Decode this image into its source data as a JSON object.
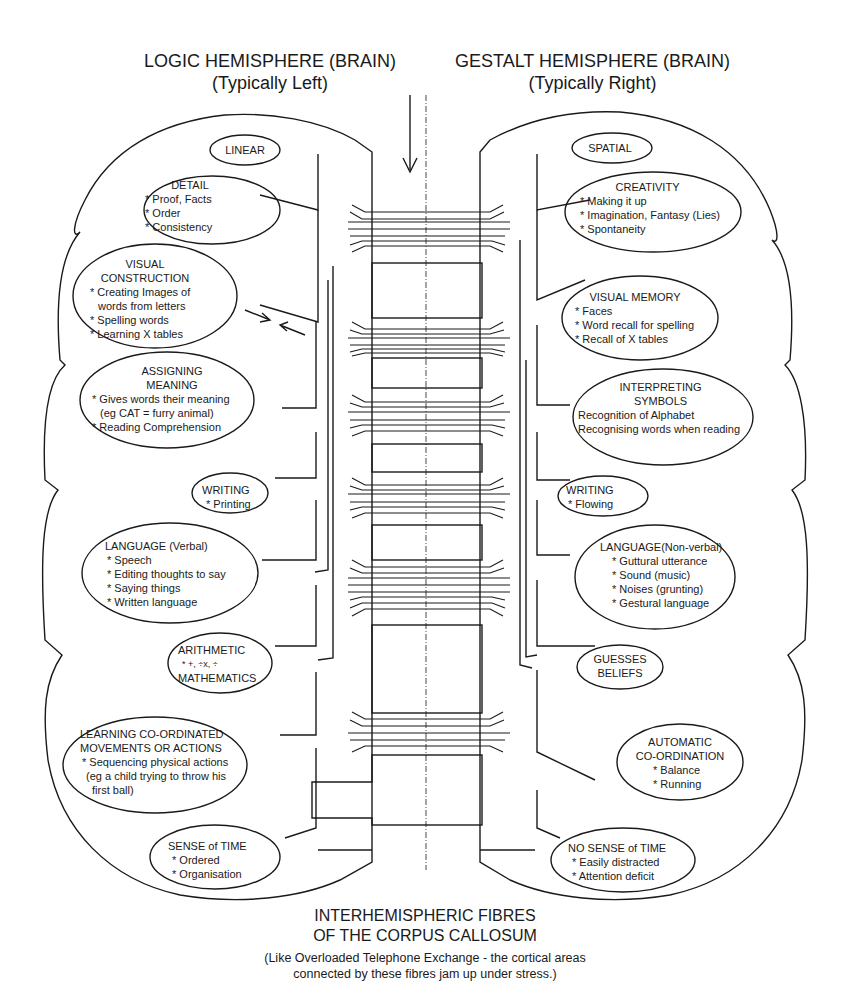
{
  "headers": {
    "left": {
      "title": "LOGIC HEMISPHERE (BRAIN)",
      "subtitle": "(Typically Left)"
    },
    "right": {
      "title": "GESTALT HEMISPHERE (BRAIN)",
      "subtitle": "(Typically Right)"
    }
  },
  "left_nodes": [
    {
      "title": "LINEAR",
      "items": []
    },
    {
      "title": "DETAIL",
      "items": [
        "* Proof, Facts",
        "* Order",
        "* Consistency"
      ]
    },
    {
      "title": "VISUAL\nCONSTRUCTION",
      "items": [
        "* Creating Images of",
        "  words from letters",
        "* Spelling words",
        "* Learning X tables"
      ]
    },
    {
      "title": "ASSIGNING\nMEANING",
      "items": [
        "* Gives words their meaning",
        "  (eg CAT = furry animal)",
        "* Reading Comprehension"
      ]
    },
    {
      "title": "WRITING",
      "items": [
        "* Printing"
      ]
    },
    {
      "title": "LANGUAGE (Verbal)",
      "items": [
        "* Speech",
        "* Editing thoughts to say",
        "* Saying things",
        "* Written language"
      ]
    },
    {
      "title": "ARITHMETIC",
      "items": [
        "* +,  ÷x,  ÷"
      ],
      "footer": "MATHEMATICS"
    },
    {
      "title": "LEARNING CO-ORDINATED\nMOVEMENTS OR ACTIONS",
      "items": [
        "* Sequencing physical actions",
        "  (eg a child trying to throw his",
        "  first ball)"
      ]
    },
    {
      "title": "SENSE of TIME",
      "items": [
        "* Ordered",
        "* Organisation"
      ]
    }
  ],
  "right_nodes": [
    {
      "title": "SPATIAL",
      "items": []
    },
    {
      "title": "CREATIVITY",
      "items": [
        "* Making it up",
        "* Imagination, Fantasy (Lies)",
        "* Spontaneity"
      ]
    },
    {
      "title": "VISUAL MEMORY",
      "items": [
        "* Faces",
        "* Word recall for spelling",
        "* Recall of X tables"
      ]
    },
    {
      "title": "INTERPRETING\nSYMBOLS",
      "items": [
        "Recognition of Alphabet",
        "Recognising words when reading"
      ]
    },
    {
      "title": "WRITING",
      "items": [
        "* Flowing"
      ]
    },
    {
      "title": "LANGUAGE(Non-verbal)",
      "items": [
        "* Guttural utterance",
        "* Sound (music)",
        "* Noises (grunting)",
        "* Gestural language"
      ]
    },
    {
      "title": "GUESSES\nBELIEFS",
      "items": []
    },
    {
      "title": "AUTOMATIC\nCO-ORDINATION",
      "items": [
        "* Balance",
        "* Running"
      ]
    },
    {
      "title": "NO SENSE of TIME",
      "items": [
        "* Easily distracted",
        "* Attention deficit"
      ]
    }
  ],
  "caption": {
    "line1": "INTERHEMISPHERIC FIBRES",
    "line2": "OF THE CORPUS CALLOSUM",
    "note1": "(Like Overloaded Telephone Exchange -  the cortical areas",
    "note2": "connected by these fibres jam up under stress.)"
  },
  "colors": {
    "ink": "#1a1a1a",
    "background": "#ffffff"
  }
}
